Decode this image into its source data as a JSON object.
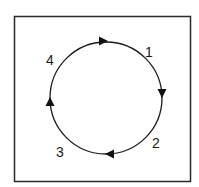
{
  "diagram": {
    "type": "cycle",
    "frame": {
      "x": 14,
      "y": 16,
      "width": 177,
      "height": 166,
      "stroke": "#2a2a2a"
    },
    "circle": {
      "cx": 106,
      "cy": 98,
      "r": 56,
      "stroke": "#1a1a1a",
      "direction": "clockwise"
    },
    "labels": [
      {
        "text": "1",
        "x": 146,
        "y": 57
      },
      {
        "text": "2",
        "x": 154,
        "y": 148
      },
      {
        "text": "3",
        "x": 58,
        "y": 157
      },
      {
        "text": "4",
        "x": 48,
        "y": 65
      }
    ],
    "arrows": [
      {
        "position": "top",
        "x": 103,
        "y": 41,
        "angle": 0
      },
      {
        "position": "right",
        "x": 162,
        "y": 93,
        "angle": 90
      },
      {
        "position": "bottom",
        "x": 110,
        "y": 154,
        "angle": 180
      },
      {
        "position": "left",
        "x": 50,
        "y": 102,
        "angle": 270
      }
    ]
  }
}
